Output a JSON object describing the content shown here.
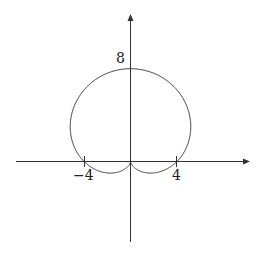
{
  "chart_data": {
    "type": "line",
    "title": "",
    "xlabel": "",
    "ylabel": "",
    "xticks": [
      -4,
      4
    ],
    "yticks": [
      8
    ],
    "xlim": [
      -10,
      10.5
    ],
    "ylim": [
      -7,
      12.5
    ],
    "grid": false,
    "series": [
      {
        "name": "r = 4 + 4 sin θ",
        "x": [
          0,
          2.83,
          4,
          4.24,
          3.46,
          2.0,
          0,
          -2.0,
          -3.46,
          -4.24,
          -4,
          -2.83,
          0
        ],
        "y": [
          8,
          6.83,
          4,
          1.76,
          0.46,
          -0.46,
          0,
          -0.46,
          0.46,
          1.76,
          4,
          6.83,
          8
        ]
      }
    ],
    "labels": {
      "x_neg": "−4",
      "x_pos": "4",
      "y_top": "8"
    },
    "colors": {
      "curve": "#333333",
      "axes": "#333333"
    }
  }
}
